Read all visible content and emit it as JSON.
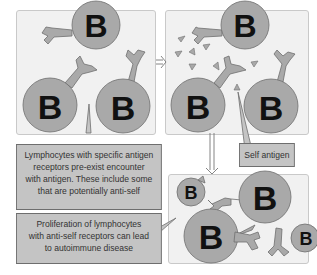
{
  "diagram": {
    "cell_label": "B",
    "callouts": {
      "pre_exist": {
        "lines": [
          "Lymphocytes with specific antigen",
          "receptors pre-exist encounter",
          "with antigen. These include some",
          "that are potentially anti-self"
        ]
      },
      "self_antigen": {
        "text": "Self antigen"
      },
      "proliferation": {
        "lines": [
          "Proliferation of lymphocytes",
          "with anti-self receptors can lead",
          "to autoimmune disease"
        ]
      }
    },
    "colors": {
      "cell_fill": "#a9a9a9",
      "cell_stroke": "#6e6e6e",
      "panel_bg": "#f1f1f1",
      "callout_bg": "#c4c4c4",
      "text": "#111111"
    }
  }
}
